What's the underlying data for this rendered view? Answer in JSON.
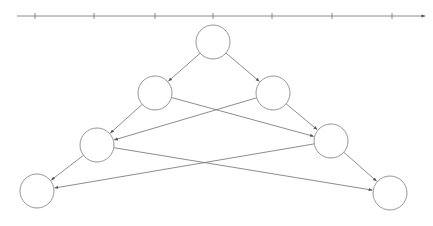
{
  "diagram": {
    "type": "tree-with-cross-edges",
    "stroke_color": "#6e6e6e",
    "node_stroke_color": "#8a8a8a",
    "axis": {
      "x1": 17,
      "x2": 425,
      "y": 16,
      "ticks": [
        35,
        94,
        155,
        213,
        272,
        332,
        392
      ]
    },
    "node_radius": 17,
    "nodes": [
      {
        "id": "n1",
        "x": 213,
        "y": 42
      },
      {
        "id": "n2",
        "x": 155,
        "y": 93
      },
      {
        "id": "n3",
        "x": 273,
        "y": 93
      },
      {
        "id": "n4",
        "x": 97,
        "y": 145
      },
      {
        "id": "n5",
        "x": 331,
        "y": 141
      },
      {
        "id": "n6",
        "x": 37,
        "y": 191
      },
      {
        "id": "n7",
        "x": 390,
        "y": 193
      }
    ],
    "edges": [
      {
        "from": "n1",
        "to": "n2"
      },
      {
        "from": "n1",
        "to": "n3"
      },
      {
        "from": "n2",
        "to": "n4"
      },
      {
        "from": "n2",
        "to": "n5"
      },
      {
        "from": "n3",
        "to": "n4"
      },
      {
        "from": "n3",
        "to": "n5"
      },
      {
        "from": "n4",
        "to": "n6"
      },
      {
        "from": "n4",
        "to": "n7"
      },
      {
        "from": "n5",
        "to": "n6"
      },
      {
        "from": "n5",
        "to": "n7"
      }
    ]
  }
}
